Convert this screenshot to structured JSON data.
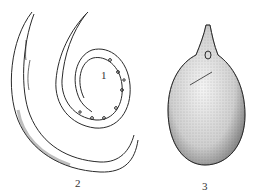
{
  "figure": {
    "labels": [
      {
        "id": "1",
        "text": "1",
        "x": 101,
        "y": 70
      },
      {
        "id": "2",
        "text": "2",
        "x": 75,
        "y": 178
      },
      {
        "id": "3",
        "text": "3",
        "x": 202,
        "y": 181
      }
    ],
    "ink_color": "#2a2a2a",
    "stipple_color": "#555555"
  }
}
